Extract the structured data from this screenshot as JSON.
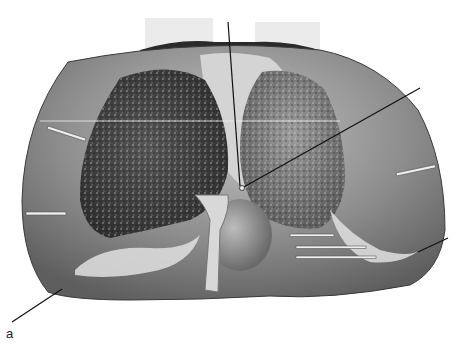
{
  "figure": {
    "panel_label": "a",
    "colors": {
      "background": "#ffffff",
      "outer_organ": "#8a8a8a",
      "outer_organ_light": "#b8b8b8",
      "left_lobe": "#4a4a4a",
      "right_lobe": "#7a7a7a",
      "central_tissue": "#cfcfcf",
      "leader_line": "#111111",
      "pin": "#e8e8e8"
    }
  }
}
